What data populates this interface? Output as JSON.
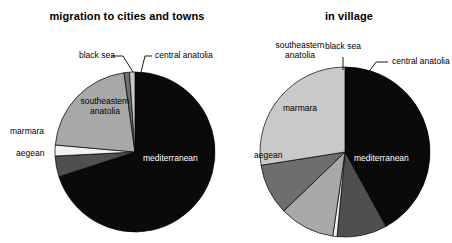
{
  "figure": {
    "background": "#ffffff",
    "width": 452,
    "height": 243
  },
  "palette": {
    "mediterranean": "#0a0a0a",
    "central_anatolia": "#4f4f4f",
    "black_sea": "#f2f2f2",
    "southeastern_anatolia": "#a8a8a8",
    "marmara": "#6e6e6e",
    "aegean": "#c9c9c9",
    "outline": "#000000",
    "text": "#000000",
    "text_on_dark": "#ffffff"
  },
  "charts": [
    {
      "id": "migration-to-cities-and-towns",
      "title": "migration to cities and towns",
      "labels": {
        "black_sea": "black sea",
        "central_anatolia": "central anatolia",
        "southeastern_anatolia_line1": "southeastern",
        "southeastern_anatolia_line2": "anatolia",
        "marmara": "marmara",
        "aegean": "aegean",
        "mediterranean": "mediterranean"
      }
    },
    {
      "id": "in-village",
      "title": "in village",
      "labels": {
        "southeastern_anatolia_line1": "southeastern",
        "southeastern_anatolia_line2": "anatolia",
        "black_sea": "black sea",
        "central_anatolia": "central anatolia",
        "marmara": "marmara",
        "aegean": "aegean",
        "mediterranean": "mediterranean"
      }
    }
  ],
  "chart_data": [
    {
      "type": "pie",
      "title": "migration to cities and towns",
      "categories": [
        "mediterranean",
        "central anatolia",
        "black sea",
        "southeastern anatolia",
        "marmara",
        "aegean"
      ],
      "values": [
        70.0,
        4.2,
        2.2,
        21.4,
        1.1,
        1.1
      ],
      "unit": "percent",
      "start_angle_deg": 0,
      "direction": "clockwise",
      "colors": [
        "#0a0a0a",
        "#4f4f4f",
        "#f2f2f2",
        "#a8a8a8",
        "#6e6e6e",
        "#c9c9c9"
      ],
      "legend": "none",
      "labels_placement": "around-and-inside"
    },
    {
      "type": "pie",
      "title": "in village",
      "categories": [
        "mediterranean",
        "central anatolia",
        "black sea",
        "southeastern anatolia",
        "marmara",
        "aegean"
      ],
      "values": [
        42.0,
        9.5,
        0.8,
        10.5,
        9.7,
        27.5
      ],
      "unit": "percent",
      "start_angle_deg": 0,
      "direction": "clockwise",
      "colors": [
        "#0a0a0a",
        "#4f4f4f",
        "#f2f2f2",
        "#a8a8a8",
        "#6e6e6e",
        "#c9c9c9"
      ],
      "legend": "none",
      "labels_placement": "around-and-inside"
    }
  ],
  "geometry": {
    "left": {
      "cx": 135,
      "cy": 152,
      "r": 80
    },
    "right": {
      "cx": 119,
      "cy": 152,
      "r": 85
    }
  }
}
